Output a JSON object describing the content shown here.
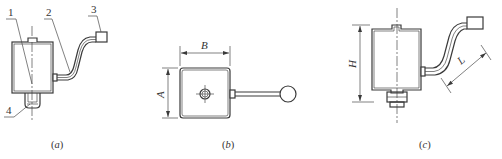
{
  "figure": {
    "panels": [
      {
        "id": "a",
        "caption": "(a)",
        "caption_letter": "a",
        "callouts": [
          "1",
          "2",
          "3",
          "4"
        ]
      },
      {
        "id": "b",
        "caption": "(b)",
        "caption_letter": "b",
        "dimensions": [
          "B",
          "A"
        ]
      },
      {
        "id": "c",
        "caption": "(c)",
        "caption_letter": "c",
        "dimensions": [
          "H",
          "L"
        ]
      }
    ],
    "colors": {
      "line": "#3a3a3a",
      "background": "#ffffff"
    }
  }
}
